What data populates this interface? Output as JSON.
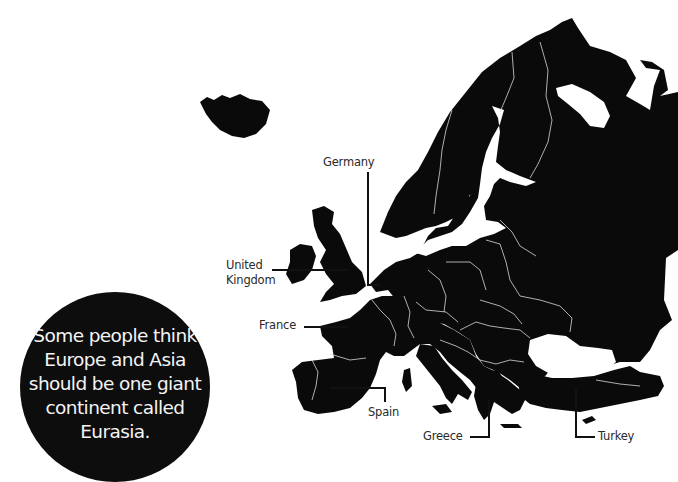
{
  "map": {
    "title": "Europe",
    "land_color": "#0a0a0a",
    "border_color": "#d8d8d8",
    "background_color": "#ffffff"
  },
  "labels": {
    "germany": "Germany",
    "united_kingdom_line1": "United",
    "united_kingdom_line2": "Kingdom",
    "france": "France",
    "spain": "Spain",
    "greece": "Greece",
    "turkey": "Turkey"
  },
  "fact": {
    "text": "Some people think Europe and Asia should be one giant continent called Eurasia.",
    "circle_color": "#0d0d0d",
    "text_color": "#f4f4f4"
  }
}
